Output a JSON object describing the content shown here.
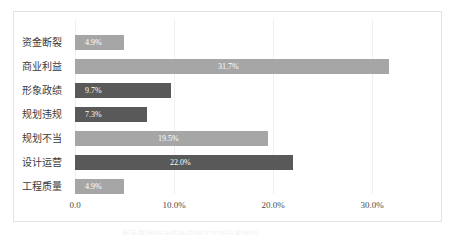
{
  "chart_data": {
    "type": "bar",
    "orientation": "horizontal",
    "title": "",
    "xlabel": "",
    "ylabel": "",
    "categories": [
      "资金断裂",
      "商业利益",
      "形象政绩",
      "规划违规",
      "规划不当",
      "设计运营",
      "工程质量"
    ],
    "values": [
      4.9,
      31.7,
      9.7,
      7.3,
      19.5,
      22.0,
      4.9
    ],
    "data_labels": [
      "4.9%",
      "31.7%",
      "9.7%",
      "7.3%",
      "19.5%",
      "22.0%",
      "4.9%"
    ],
    "bar_colors": [
      "#a6a6a6",
      "#a6a6a6",
      "#595959",
      "#595959",
      "#a6a6a6",
      "#595959",
      "#a6a6a6"
    ],
    "xlim": [
      0,
      35.0
    ],
    "xticks": [
      0,
      10,
      20,
      30
    ],
    "xtick_labels": [
      "0.0",
      "10.0%",
      "20.0%",
      "30.0%"
    ],
    "grid": true,
    "legend": false,
    "data_label_color": "#ffffff",
    "frame_border_color": "#e2e2e2",
    "gridline_color": "#efefef"
  },
  "caption": {
    "clipped_text": "图表数据统计结果说明文字部分被裁切"
  }
}
